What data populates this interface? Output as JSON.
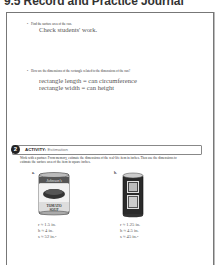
{
  "header": {
    "title": "9.5 Record and Practice Journal"
  },
  "questions": [
    {
      "prompt": "Find the surface area of the can.",
      "answer_lines": [
        "Check students' work."
      ]
    },
    {
      "prompt": "How are the dimensions of the rectangle related to the dimensions of the can?",
      "answer_lines": [
        "rectangle length = can circumference",
        "rectangle width = can height"
      ]
    }
  ],
  "activity": {
    "number": "2",
    "label": "ACTIVITY:",
    "title": "Estimation",
    "instructions": "Work with a partner. From memory, estimate the dimensions of the real-life item in inches. Then use the dimensions to estimate the surface area of the item in square inches.",
    "items": [
      {
        "letter": "a.",
        "image": "tomato-soup-can",
        "can_label": "TOMATO SOUP",
        "r": "r ≈ 1.5 in.",
        "h": "h ≈ 4 in.",
        "s": "s ≈ 52 in.",
        "s_exp": "2"
      },
      {
        "letter": "b.",
        "image": "soda-can",
        "r": "r ≈ 1.25 in.",
        "h": "h ≈ 4.5 in.",
        "s": "s ≈ 45 in.",
        "s_exp": "2"
      }
    ]
  },
  "colors": {
    "answer_gray": "#555555",
    "border": "#777777",
    "badge": "#222222"
  }
}
